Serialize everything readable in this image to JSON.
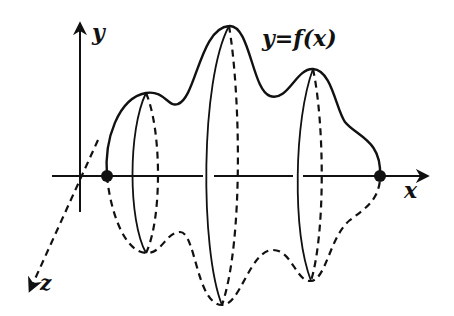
{
  "figure": {
    "axes": {
      "x_label": "x",
      "y_label": "y",
      "z_label": "z"
    },
    "curve_label": "y=f(x)",
    "endpoints": [
      {
        "name": "left-endpoint",
        "cx": 107,
        "cy": 176
      },
      {
        "name": "right-endpoint",
        "cx": 380,
        "cy": 176
      }
    ],
    "cross_sections": [
      {
        "name": "section-1",
        "x": 146,
        "top_y": 93,
        "bottom_y": 253
      },
      {
        "name": "section-2",
        "x": 229,
        "top_y": 26,
        "bottom_y": 305
      },
      {
        "name": "section-3",
        "x": 313,
        "top_y": 69,
        "bottom_y": 281
      }
    ],
    "colors": {
      "ink": "#111111",
      "background": "#ffffff"
    }
  }
}
